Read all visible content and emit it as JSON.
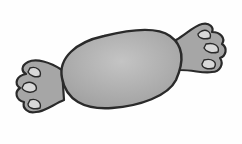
{
  "image": {
    "subject": "wrapped candy illustration",
    "colors": {
      "background": "#fefefe",
      "outline": "#2a2a2a",
      "body_fill": "#a9a9a9",
      "body_highlight": "#c4c4c4",
      "wrapper_fill": "#a6a6a6",
      "wrapper_inner": "#d8d8d8"
    }
  }
}
